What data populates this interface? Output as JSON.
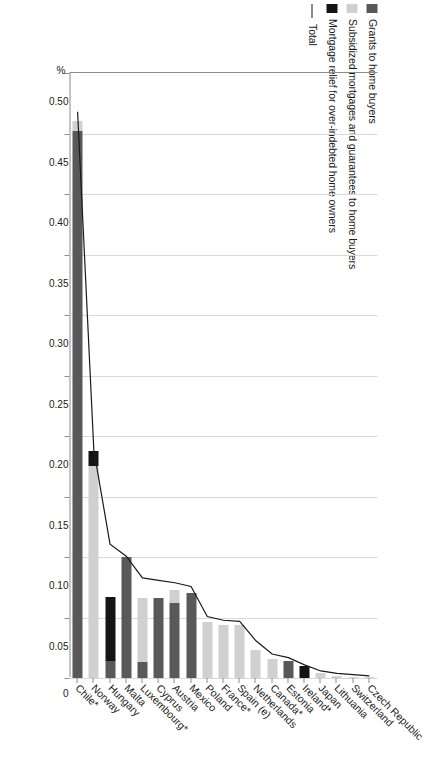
{
  "legend": {
    "items": [
      {
        "label": "Grants to home buyers",
        "color": "#595959",
        "type": "swatch"
      },
      {
        "label": "Subsidized mortgages and guarantees to home buyers",
        "color": "#d0d0d0",
        "type": "swatch"
      },
      {
        "label": "Mortgage relief for over-indebted home owners",
        "color": "#141414",
        "type": "swatch"
      },
      {
        "label": "Total",
        "color": "#1a1a1a",
        "type": "line"
      }
    ]
  },
  "axis": {
    "unit_label": "%",
    "tick_labels": [
      "0.50",
      "0.45",
      "0.40",
      "0.35",
      "0.30",
      "0.25",
      "0.20",
      "0.15",
      "0.10",
      "0.05",
      "0"
    ]
  },
  "chart_data": {
    "type": "bar",
    "title": "",
    "subtitle": "",
    "orientation": "horizontal-rotated",
    "stacked": true,
    "xlabel": "",
    "ylabel": "%",
    "ylim": [
      0,
      0.5
    ],
    "ytick_step": 0.05,
    "grid": true,
    "legend_position": "top-left",
    "categories": [
      "Chile*",
      "Norway",
      "Hungary",
      "Malta",
      "Luxembourg*",
      "Cyprus",
      "Austria",
      "Mexico",
      "Poland",
      "France*",
      "Spain (e)",
      "Netherlands",
      "Canada*",
      "Estonia",
      "Ireland*",
      "Japan",
      "Lithuania",
      "Switzerland",
      "Czech Republic"
    ],
    "series": [
      {
        "name": "Grants to home buyers",
        "color": "#595959",
        "values": [
          0.452,
          0.0,
          0.014,
          0.1,
          0.013,
          0.066,
          0.062,
          0.07,
          0.0,
          0.0,
          0.0,
          0.0,
          0.0,
          0.014,
          0.0,
          0.0,
          0.0,
          0.0,
          0.0
        ]
      },
      {
        "name": "Subsidized mortgages and guarantees to home buyers",
        "color": "#d0d0d0",
        "values": [
          0.008,
          0.175,
          0.0,
          0.0,
          0.053,
          0.0,
          0.011,
          0.0,
          0.046,
          0.044,
          0.044,
          0.023,
          0.016,
          0.0,
          0.0,
          0.004,
          0.002,
          0.001,
          0.001
        ]
      },
      {
        "name": "Mortgage relief for over-indebted home owners",
        "color": "#141414",
        "values": [
          0.0,
          0.013,
          0.053,
          0.0,
          0.0,
          0.0,
          0.0,
          0.0,
          0.0,
          0.0,
          0.0,
          0.0,
          0.0,
          0.0,
          0.01,
          0.0,
          0.0,
          0.0,
          0.0
        ]
      },
      {
        "name": "Total",
        "type": "line",
        "color": "#1a1a1a",
        "values": [
          0.468,
          0.188,
          0.11,
          0.1,
          0.082,
          0.08,
          0.078,
          0.075,
          0.05,
          0.047,
          0.046,
          0.03,
          0.019,
          0.016,
          0.01,
          0.005,
          0.003,
          0.002,
          0.001
        ]
      }
    ]
  }
}
